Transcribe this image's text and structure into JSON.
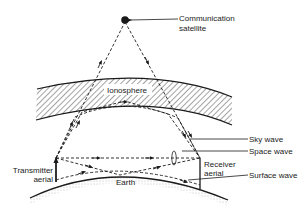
{
  "labels": {
    "satellite_line1": "Communication",
    "satellite_line2": "satellite",
    "ionosphere": "Ionosphere",
    "sky_wave": "Sky wave",
    "space_wave": "Space wave",
    "surface_wave": "Surface wave",
    "transmitter_line1": "Transmitter",
    "transmitter_line2": "aerial",
    "receiver_line1": "Receiver",
    "receiver_line2": "aerial",
    "earth": "Earth"
  },
  "colors": {
    "ink": "#1a1a1a",
    "background": "#ffffff"
  }
}
